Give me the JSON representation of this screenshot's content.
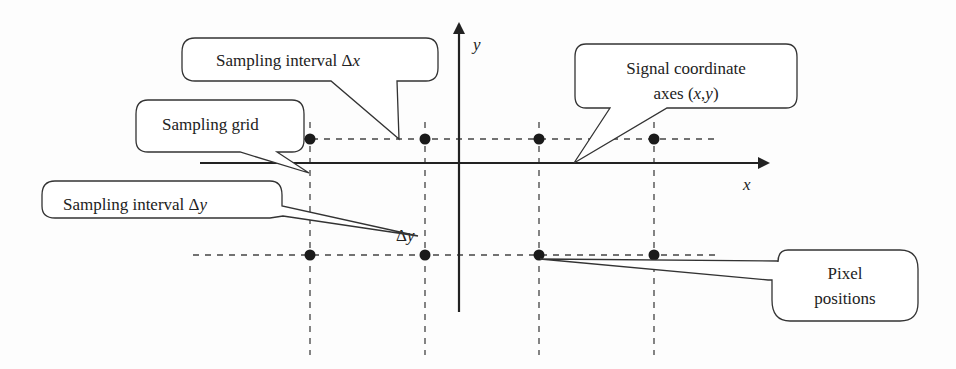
{
  "diagram": {
    "axes": {
      "x_label": "x",
      "y_label": "y"
    },
    "delta_y_label": "Δy",
    "callouts": {
      "sampling_interval_x": {
        "text": "Sampling interval Δx"
      },
      "sampling_grid": {
        "text": "Sampling grid"
      },
      "sampling_interval_y": {
        "text": "Sampling interval Δy"
      },
      "signal_axes": {
        "line1": "Signal coordinate",
        "line2": "axes (x,y)"
      },
      "pixel_positions": {
        "line1": "Pixel",
        "line2": "positions"
      }
    },
    "grid": {
      "columns_x": [
        310,
        425,
        539,
        654
      ],
      "rows_y": [
        139,
        255
      ]
    },
    "colors": {
      "ink": "#222222",
      "dash": "#444444",
      "background": "#fdfdfd"
    }
  }
}
